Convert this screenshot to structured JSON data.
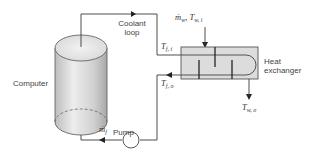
{
  "diagram": {
    "components": {
      "computer": {
        "label": "Computer"
      },
      "coolant_loop": {
        "label_line1": "Coolant",
        "label_line2": "loop"
      },
      "heat_exchanger": {
        "label_line1": "Heat",
        "label_line2": "exchanger"
      },
      "pump": {
        "label": "Pump"
      }
    },
    "variables": {
      "water_inlet": {
        "symbol": "ṁ",
        "sub1": "w",
        "sep": ", ",
        "symbol2": "T",
        "sub2": "w, i"
      },
      "fluid_inlet_temp": {
        "symbol": "T",
        "sub": "f, i"
      },
      "fluid_outlet_temp": {
        "symbol": "T",
        "sub": "f, o"
      },
      "water_outlet_temp": {
        "symbol": "T",
        "sub": "w, o"
      },
      "fluid_mass_flow": {
        "symbol": "ṁ",
        "sub": "f"
      }
    },
    "colors": {
      "line": "#3a3a3a",
      "cylinder_light": "#e6e6e6",
      "cylinder_dark": "#b8b8b8",
      "exchanger_fill": "#dcdcdc"
    }
  }
}
